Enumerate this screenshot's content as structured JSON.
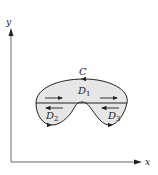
{
  "figure": {
    "axes": {
      "x_label": "x",
      "y_label": "y"
    },
    "curve_label": "C",
    "regions": [
      {
        "name": "D",
        "subscript": "1"
      },
      {
        "name": "D",
        "subscript": "2"
      },
      {
        "name": "D",
        "subscript": "3"
      }
    ],
    "colors": {
      "region_fill": "#e6e6e6",
      "stroke": "#222222",
      "axis": "#555555"
    }
  }
}
